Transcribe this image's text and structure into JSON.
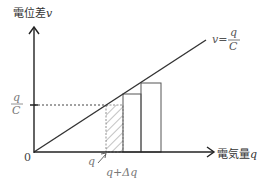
{
  "diagram": {
    "y_axis": {
      "label_text": "電位差",
      "label_var": "v"
    },
    "x_axis": {
      "label_text": "電気量",
      "label_var": "q"
    },
    "origin_label": "0",
    "line_label": {
      "lhs": "v=",
      "numerator": "q",
      "denominator": "C"
    },
    "y_tick": {
      "numerator": "q",
      "denominator": "C"
    },
    "x_ticks": {
      "q": "q",
      "q_plus_dq": "q+Δq"
    },
    "colors": {
      "axis": "#222222",
      "line": "#333333",
      "bars": "#555555",
      "hatch": "#888888",
      "label_gray": "#666666"
    }
  }
}
